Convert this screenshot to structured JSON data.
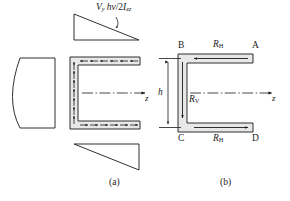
{
  "figure": {
    "type": "engineering-diagram",
    "background_color": "#ffffff",
    "line_color": "#1a1a1a",
    "flange_fill_color": "#e8e8e8"
  },
  "panel_a": {
    "caption": "(a)",
    "shear_flow_formula": {
      "symbol": "V",
      "symbol_sub": "y",
      "numerator_rest": "hv",
      "divider": "/2",
      "denominator": "I",
      "denominator_sub": "zz",
      "full_text": "Vᵧ hv/2I₂₂"
    },
    "axis_label": "z",
    "top_triangle_label": "top flange shear flow distribution",
    "bottom_triangle_label": "bottom flange shear flow distribution",
    "web_distribution_label": "parabolic web shear stress distribution",
    "top_flange_arrow_direction": "left",
    "bottom_flange_arrow_direction": "right",
    "web_arrow_direction": "up",
    "top_flange_arrow_count": 6,
    "bottom_flange_arrow_count": 6,
    "web_arrow_count": 7
  },
  "panel_b": {
    "caption": "(b)",
    "axis_label": "z",
    "corners": {
      "top_left": "B",
      "top_right": "A",
      "bottom_left": "C",
      "bottom_right": "D"
    },
    "forces": {
      "horizontal_top": {
        "symbol": "R",
        "sub": "H",
        "direction": "left"
      },
      "horizontal_bottom": {
        "symbol": "R",
        "sub": "H",
        "direction": "right"
      },
      "vertical_web": {
        "symbol": "R",
        "sub": "V",
        "direction": "down"
      }
    },
    "dimension": {
      "symbol": "h",
      "description": "web height between flange centerlines"
    }
  }
}
